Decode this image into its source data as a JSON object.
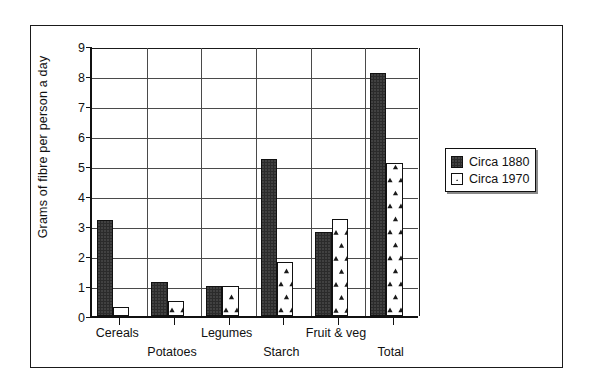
{
  "chart_data": {
    "type": "bar",
    "title": "",
    "xlabel": "",
    "ylabel": "Grams of fibre per person a day",
    "ylim": [
      0,
      9
    ],
    "ytick_labels": [
      "0",
      "1",
      "2",
      "3",
      "4",
      "5",
      "6",
      "7",
      "8",
      "9"
    ],
    "ytick_values": [
      0,
      1,
      2,
      3,
      4,
      5,
      6,
      7,
      8,
      9
    ],
    "grid": true,
    "grid_axis": "both",
    "legend_position": "right-outside",
    "categories": [
      "Cereals",
      "Potatoes",
      "Legumes",
      "Starch",
      "Fruit & veg",
      "Total"
    ],
    "series": [
      {
        "name": "Circa 1880",
        "fill": "dark-solid",
        "color": "#2b2b2b",
        "values": [
          3.2,
          1.15,
          1.0,
          5.25,
          2.8,
          8.1
        ]
      },
      {
        "name": "Circa 1970",
        "fill": "white-triangle-pattern",
        "color": "#ffffff",
        "values": [
          0.3,
          0.5,
          1.0,
          1.8,
          3.25,
          5.1
        ]
      }
    ]
  },
  "legend": {
    "entries": [
      {
        "label": "Circa 1880"
      },
      {
        "label": "Circa 1970"
      }
    ]
  },
  "axis": {
    "y_title": "Grams of fibre per person a day"
  }
}
